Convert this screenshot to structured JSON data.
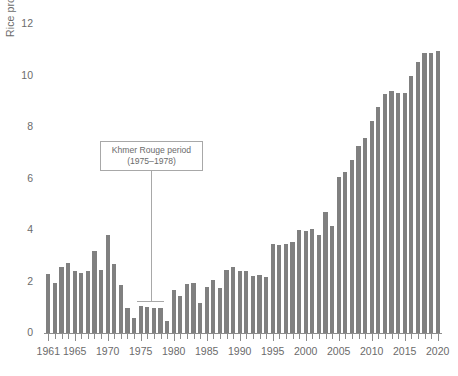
{
  "chart_data": {
    "type": "bar",
    "title": "",
    "xlabel": "",
    "ylabel": "Rice production (millions of metric tons)",
    "ylim": [
      0,
      12
    ],
    "xlim": [
      1960.5,
      2020.5
    ],
    "ytick_labels": [
      "0",
      "2",
      "4",
      "6",
      "8",
      "10",
      "12"
    ],
    "ytick_values": [
      0,
      2,
      4,
      6,
      8,
      10,
      12
    ],
    "xtick_labels": [
      "1961",
      "1965",
      "1970",
      "1975",
      "1980",
      "1985",
      "1990",
      "1995",
      "2000",
      "2005",
      "2010",
      "2015",
      "2020"
    ],
    "xtick_values": [
      1961,
      1965,
      1970,
      1975,
      1980,
      1985,
      1990,
      1995,
      2000,
      2005,
      2010,
      2015,
      2020
    ],
    "grid": false,
    "legend": "none",
    "bar_color": "#808080",
    "axis_color": "#8c8c8c",
    "text_color": "#6b6b6b",
    "categories": [
      1961,
      1962,
      1963,
      1964,
      1965,
      1966,
      1967,
      1968,
      1969,
      1970,
      1971,
      1972,
      1973,
      1974,
      1975,
      1976,
      1977,
      1978,
      1979,
      1980,
      1981,
      1982,
      1983,
      1984,
      1985,
      1986,
      1987,
      1988,
      1989,
      1990,
      1991,
      1992,
      1993,
      1994,
      1995,
      1996,
      1997,
      1998,
      1999,
      2000,
      2001,
      2002,
      2003,
      2004,
      2005,
      2006,
      2007,
      2008,
      2009,
      2010,
      2011,
      2012,
      2013,
      2014,
      2015,
      2016,
      2017,
      2018,
      2019,
      2020
    ],
    "values": [
      2.31,
      1.96,
      2.55,
      2.72,
      2.4,
      2.32,
      2.39,
      3.2,
      2.45,
      3.79,
      2.67,
      1.86,
      0.98,
      0.6,
      1.04,
      1.0,
      0.97,
      0.98,
      0.48,
      1.67,
      1.42,
      1.91,
      1.95,
      1.15,
      1.77,
      2.05,
      1.73,
      2.44,
      2.57,
      2.41,
      2.39,
      2.22,
      2.26,
      2.18,
      3.45,
      3.41,
      3.46,
      3.52,
      3.99,
      3.98,
      4.03,
      3.82,
      4.71,
      4.17,
      6.05,
      6.26,
      6.73,
      7.25,
      7.59,
      8.25,
      8.78,
      9.29,
      9.39,
      9.32,
      9.33,
      9.97,
      10.53,
      10.89,
      10.89,
      10.96
    ]
  },
  "annotation": {
    "line1": "Khmer Rouge period",
    "line2": "(1975–1978)",
    "span_start": 1975,
    "span_end": 1978
  }
}
